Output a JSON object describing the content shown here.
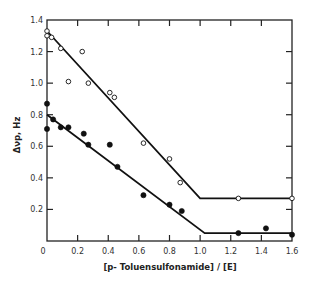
{
  "chart_data": {
    "type": "scatter",
    "title": "",
    "xlabel": "[p- Toluensulfonamide] / [E]",
    "ylabel": "Δνp, Hz",
    "xlim": [
      0,
      1.6
    ],
    "ylim": [
      0,
      1.4
    ],
    "grid": false,
    "legend": null,
    "x_ticks": [
      0,
      0.2,
      0.4,
      0.6,
      0.8,
      1.0,
      1.2,
      1.4,
      1.6
    ],
    "x_tick_labels": [
      "0",
      "0.2",
      "0.4",
      "0.6",
      "0.8",
      "1.0",
      "1.2",
      "1.4",
      "1.6"
    ],
    "y_ticks": [
      0.2,
      0.4,
      0.6,
      0.8,
      1.0,
      1.2,
      1.4
    ],
    "y_tick_labels": [
      "0.2",
      "0.4",
      "0.6",
      "0.8",
      "1.0",
      "1.2",
      "1.4"
    ],
    "series": [
      {
        "name": "open circles",
        "marker": "open-circle",
        "points": [
          [
            0,
            1.33
          ],
          [
            0,
            1.3
          ],
          [
            0.03,
            1.29
          ],
          [
            0.09,
            1.22
          ],
          [
            0.23,
            1.2
          ],
          [
            0.14,
            1.01
          ],
          [
            0.27,
            1.0
          ],
          [
            0.41,
            0.94
          ],
          [
            0.44,
            0.91
          ],
          [
            0.63,
            0.62
          ],
          [
            0.8,
            0.52
          ],
          [
            0.87,
            0.37
          ],
          [
            1.25,
            0.27
          ],
          [
            1.6,
            0.27
          ]
        ],
        "fit_line": [
          [
            0,
            1.33
          ],
          [
            1.0,
            0.27
          ],
          [
            1.6,
            0.27
          ]
        ]
      },
      {
        "name": "filled circles",
        "marker": "filled-circle",
        "points": [
          [
            0,
            0.87
          ],
          [
            0,
            0.71
          ],
          [
            0.04,
            0.77
          ],
          [
            0.09,
            0.72
          ],
          [
            0.14,
            0.72
          ],
          [
            0.24,
            0.68
          ],
          [
            0.27,
            0.61
          ],
          [
            0.41,
            0.61
          ],
          [
            0.46,
            0.47
          ],
          [
            0.63,
            0.29
          ],
          [
            0.8,
            0.23
          ],
          [
            0.88,
            0.19
          ],
          [
            1.25,
            0.05
          ],
          [
            1.43,
            0.08
          ],
          [
            1.6,
            0.04
          ]
        ],
        "fit_line": [
          [
            0,
            0.8
          ],
          [
            1.03,
            0.05
          ],
          [
            1.6,
            0.05
          ]
        ]
      }
    ]
  },
  "labels": {
    "xlabel": "[p- Toluensulfonamide] / [E]",
    "ylabel": "Δνp, Hz"
  }
}
